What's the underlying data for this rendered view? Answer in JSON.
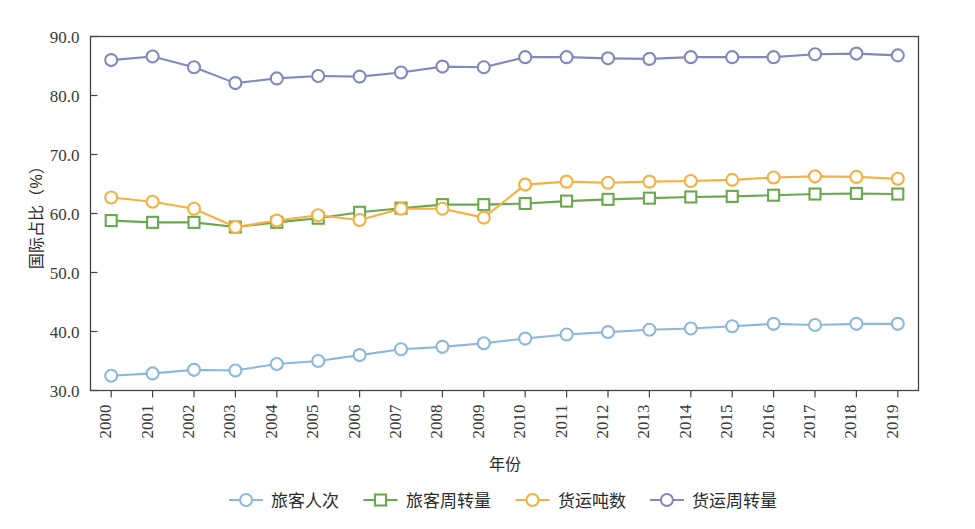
{
  "chart_data": {
    "type": "line",
    "title": "",
    "xlabel": "年份",
    "ylabel": "国际占比（%）",
    "xlim": [
      2000,
      2019
    ],
    "ylim": [
      30.0,
      90.0
    ],
    "grid": false,
    "legend_position": "bottom",
    "y_ticks": [
      "30.0",
      "40.0",
      "50.0",
      "60.0",
      "70.0",
      "80.0",
      "90.0"
    ],
    "y_tick_values": [
      30.0,
      40.0,
      50.0,
      60.0,
      70.0,
      80.0,
      90.0
    ],
    "categories": [
      "2000",
      "2001",
      "2002",
      "2003",
      "2004",
      "2005",
      "2006",
      "2007",
      "2008",
      "2009",
      "2010",
      "2011",
      "2012",
      "2013",
      "2014",
      "2015",
      "2016",
      "2017",
      "2018",
      "2019"
    ],
    "series": [
      {
        "name": "旅客人次",
        "color": "#8cb8dd",
        "marker": "circle",
        "values": [
          32.5,
          32.9,
          33.5,
          33.4,
          34.5,
          35.0,
          36.0,
          37.0,
          37.4,
          38.0,
          38.8,
          39.5,
          39.9,
          40.3,
          40.5,
          40.9,
          41.3,
          41.1,
          41.3,
          41.3
        ]
      },
      {
        "name": "旅客周转量",
        "color": "#6aa84f",
        "marker": "square",
        "values": [
          58.8,
          58.5,
          58.5,
          57.7,
          58.5,
          59.2,
          60.2,
          60.9,
          61.5,
          61.5,
          61.7,
          62.1,
          62.4,
          62.6,
          62.8,
          62.9,
          63.1,
          63.3,
          63.4,
          63.3
        ]
      },
      {
        "name": "货运吨数",
        "color": "#f5b041",
        "marker": "circle",
        "values": [
          62.7,
          62.0,
          60.8,
          57.7,
          58.8,
          59.7,
          58.9,
          60.8,
          60.8,
          59.3,
          64.9,
          65.4,
          65.2,
          65.4,
          65.5,
          65.7,
          66.1,
          66.3,
          66.2,
          65.9
        ]
      },
      {
        "name": "货运周转量",
        "color": "#8289bd",
        "marker": "circle",
        "values": [
          86.0,
          86.6,
          84.8,
          82.1,
          82.9,
          83.3,
          83.2,
          83.9,
          84.9,
          84.8,
          86.5,
          86.5,
          86.3,
          86.2,
          86.5,
          86.5,
          86.5,
          87.0,
          87.1,
          86.8
        ]
      }
    ]
  }
}
